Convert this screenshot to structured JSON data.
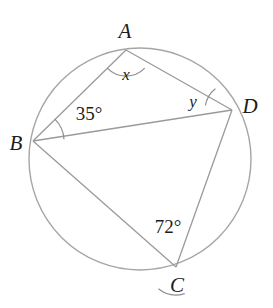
{
  "figure": {
    "type": "circle-geometry-diagram",
    "canvas": {
      "width": 273,
      "height": 308
    },
    "colors": {
      "background": "#ffffff",
      "circle_stroke": "#a6a6a6",
      "chord_stroke": "#9a9a9a",
      "arc_stroke": "#8f8f8f",
      "label_text": "#1c1c1c"
    },
    "circle": {
      "cx": 140,
      "cy": 159,
      "r": 111
    },
    "vertices": [
      {
        "id": "A",
        "label": "A",
        "x": 126,
        "y": 50,
        "label_x": 125,
        "label_y": 31
      },
      {
        "id": "B",
        "label": "B",
        "x": 33,
        "y": 141,
        "label_x": 16,
        "label_y": 143
      },
      {
        "id": "C",
        "label": "C",
        "x": 176,
        "y": 267,
        "label_x": 177,
        "label_y": 285
      },
      {
        "id": "D",
        "label": "D",
        "x": 232,
        "y": 110,
        "label_x": 250,
        "label_y": 106
      }
    ],
    "chords": [
      {
        "name": "chord-AB",
        "from": "A",
        "to": "B"
      },
      {
        "name": "chord-AD",
        "from": "A",
        "to": "D"
      },
      {
        "name": "chord-BD",
        "from": "B",
        "to": "D"
      },
      {
        "name": "chord-BC",
        "from": "B",
        "to": "C"
      },
      {
        "name": "chord-CD",
        "from": "C",
        "to": "D"
      }
    ],
    "angles": [
      {
        "id": "angle-A",
        "vertex": "A",
        "label": "x",
        "is_unknown": true,
        "label_x": 126,
        "label_y": 74,
        "arc_radius": 26,
        "arc_start_deg": 44,
        "arc_end_deg": 136
      },
      {
        "id": "angle-B",
        "vertex": "B",
        "label": "35°",
        "value": 35,
        "is_unknown": false,
        "label_x": 89,
        "label_y": 113,
        "arc_radius": 31,
        "arc_start_deg": -45,
        "arc_end_deg": -3
      },
      {
        "id": "angle-C",
        "vertex": "C",
        "label": "72°",
        "value": 72,
        "is_unknown": false,
        "label_x": 168,
        "label_y": 226,
        "arc_radius": 28,
        "arc_start_deg": 129,
        "arc_end_deg": 72
      },
      {
        "id": "angle-D",
        "vertex": "D",
        "label": "y",
        "is_unknown": true,
        "label_x": 193,
        "label_y": 101,
        "arc_radius": 27,
        "arc_start_deg": 190,
        "arc_end_deg": 232
      }
    ]
  }
}
